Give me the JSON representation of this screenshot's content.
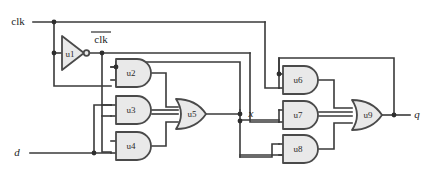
{
  "diagram": {
    "type": "logic-circuit"
  },
  "ports": {
    "clk_in": "clk",
    "clk_bar": "clk",
    "d_in": "d",
    "x_node": "x",
    "q_out": "q"
  },
  "gates": [
    {
      "id": "u1",
      "label": "u1",
      "kind": "inverter",
      "x": 60,
      "y": 53
    },
    {
      "id": "u2",
      "label": "u2",
      "kind": "and",
      "x": 128,
      "y": 73
    },
    {
      "id": "u3",
      "label": "u3",
      "kind": "and",
      "x": 128,
      "y": 110
    },
    {
      "id": "u4",
      "label": "u4",
      "kind": "and",
      "x": 128,
      "y": 146
    },
    {
      "id": "u5",
      "label": "u5",
      "kind": "or",
      "x": 192,
      "y": 114
    },
    {
      "id": "u6",
      "label": "u6",
      "kind": "and",
      "x": 295,
      "y": 80
    },
    {
      "id": "u7",
      "label": "u7",
      "kind": "and",
      "x": 295,
      "y": 115
    },
    {
      "id": "u8",
      "label": "u8",
      "kind": "and",
      "x": 295,
      "y": 149
    },
    {
      "id": "u9",
      "label": "u9",
      "kind": "or",
      "x": 368,
      "y": 115
    }
  ],
  "colors": {
    "wire": "#3a3a3a",
    "gate_fill": "#e9e9e9",
    "gate_stroke": "#4a4a4a",
    "junction": "#2e2e2e",
    "background": "#ffffff",
    "text": "#1d1d1d"
  }
}
